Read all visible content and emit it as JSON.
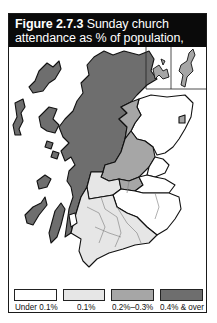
{
  "title": {
    "figure_label": "Figure 2.7.3",
    "text_line1": " Sunday church",
    "text_line2": "attendance as % of population, 2002"
  },
  "map": {
    "region": "Scotland",
    "subject": "Sunday church attendance as % of population, 2002",
    "insets": [
      "Orkney",
      "Shetland"
    ]
  },
  "legend": {
    "items": [
      {
        "label": "Under 0.1%",
        "color": "#ffffff"
      },
      {
        "label": "0.1%",
        "color": "#e6e6e6"
      },
      {
        "label": "0.2%–0.3%",
        "color": "#a6a6a6"
      },
      {
        "label": "0.4% & over",
        "color": "#6e6e6e"
      }
    ]
  },
  "colors": {
    "frame": "#1a1a1a",
    "title_bg": "#0a0a0a",
    "title_fg": "#ffffff",
    "outline": "#111111",
    "inner_boundary": "#7a7a7a"
  }
}
